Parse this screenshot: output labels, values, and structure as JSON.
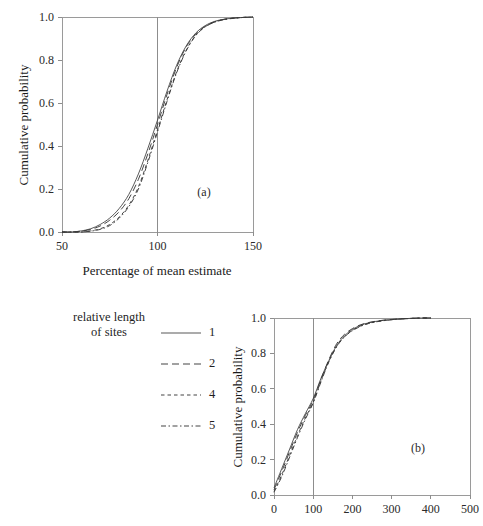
{
  "figure": {
    "background": "#ffffff",
    "line_color": "#3a3a3a",
    "frame_color": "#9a9a9a"
  },
  "legend": {
    "title_line_1": "relative length",
    "title_line_2": "of sites",
    "entries": [
      {
        "key": "1",
        "style": "solid"
      },
      {
        "key": "2",
        "style": "long-dash"
      },
      {
        "key": "4",
        "style": "short-dash"
      },
      {
        "key": "5",
        "style": "dash-dot"
      }
    ]
  },
  "chart_data": [
    {
      "type": "line",
      "tag": "(a)",
      "title": "",
      "xlabel": "Percentage of mean estimate",
      "ylabel": "Cumulative probability",
      "xlim": [
        50,
        150
      ],
      "ylim": [
        0.0,
        1.0
      ],
      "xticks": [
        50,
        100,
        150
      ],
      "xticklabels": [
        "50",
        "100",
        "150"
      ],
      "yticks": [
        0.0,
        0.2,
        0.4,
        0.6,
        0.8,
        1.0
      ],
      "yticklabels": [
        "0.0",
        "0.2",
        "0.4",
        "0.6",
        "0.8",
        "1.0"
      ],
      "grid": false,
      "reference_line_x": 100,
      "legend_position": "external-left",
      "x": [
        50,
        55,
        60,
        65,
        70,
        75,
        80,
        85,
        90,
        95,
        100,
        105,
        110,
        115,
        120,
        125,
        130,
        135,
        140,
        145,
        150
      ],
      "series": [
        {
          "name": "1",
          "style": "solid",
          "values": [
            0.0,
            0.0,
            0.005,
            0.015,
            0.035,
            0.065,
            0.11,
            0.175,
            0.27,
            0.39,
            0.52,
            0.655,
            0.775,
            0.865,
            0.925,
            0.96,
            0.98,
            0.99,
            0.995,
            0.998,
            1.0
          ]
        },
        {
          "name": "2",
          "style": "long-dash",
          "values": [
            0.0,
            0.0,
            0.004,
            0.012,
            0.028,
            0.055,
            0.095,
            0.155,
            0.245,
            0.365,
            0.5,
            0.64,
            0.765,
            0.86,
            0.92,
            0.957,
            0.978,
            0.989,
            0.995,
            0.998,
            1.0
          ]
        },
        {
          "name": "4",
          "style": "short-dash",
          "values": [
            0.0,
            0.0,
            0.0,
            0.005,
            0.015,
            0.035,
            0.07,
            0.125,
            0.21,
            0.335,
            0.475,
            0.615,
            0.745,
            0.845,
            0.915,
            0.955,
            0.977,
            0.989,
            0.995,
            0.998,
            1.0
          ]
        },
        {
          "name": "5",
          "style": "dash-dot",
          "values": [
            0.0,
            0.0,
            0.0,
            0.004,
            0.012,
            0.03,
            0.065,
            0.118,
            0.2,
            0.325,
            0.465,
            0.608,
            0.74,
            0.842,
            0.913,
            0.954,
            0.976,
            0.988,
            0.994,
            0.998,
            1.0
          ]
        }
      ]
    },
    {
      "type": "line",
      "tag": "(b)",
      "title": "",
      "xlabel": "",
      "ylabel": "Cumulative probability",
      "xlim": [
        0,
        500
      ],
      "ylim": [
        0.0,
        1.0
      ],
      "xticks": [
        0,
        100,
        200,
        300,
        400,
        500
      ],
      "xticklabels": [
        "0",
        "100",
        "200",
        "300",
        "400",
        "500"
      ],
      "yticks": [
        0.0,
        0.2,
        0.4,
        0.6,
        0.8,
        1.0
      ],
      "yticklabels": [
        "0.0",
        "0.2",
        "0.4",
        "0.6",
        "0.8",
        "1.0"
      ],
      "grid": false,
      "reference_line_x": 100,
      "x": [
        0,
        20,
        40,
        60,
        80,
        100,
        120,
        140,
        160,
        180,
        200,
        220,
        240,
        260,
        280,
        300,
        320,
        340,
        360,
        380,
        400
      ],
      "series": [
        {
          "name": "1",
          "style": "solid",
          "values": [
            0.04,
            0.15,
            0.26,
            0.37,
            0.46,
            0.545,
            0.66,
            0.76,
            0.845,
            0.9,
            0.935,
            0.958,
            0.972,
            0.981,
            0.987,
            0.991,
            0.994,
            0.997,
            0.999,
            1.0,
            1.0
          ]
        },
        {
          "name": "2",
          "style": "long-dash",
          "values": [
            0.03,
            0.135,
            0.245,
            0.355,
            0.45,
            0.535,
            0.655,
            0.765,
            0.855,
            0.908,
            0.94,
            0.961,
            0.974,
            0.982,
            0.988,
            0.992,
            0.995,
            0.997,
            0.999,
            1.0,
            1.0
          ]
        },
        {
          "name": "4",
          "style": "short-dash",
          "values": [
            0.02,
            0.115,
            0.225,
            0.335,
            0.435,
            0.525,
            0.645,
            0.755,
            0.84,
            0.895,
            0.93,
            0.954,
            0.969,
            0.979,
            0.986,
            0.991,
            0.994,
            0.997,
            0.999,
            1.0,
            1.0
          ]
        },
        {
          "name": "5",
          "style": "dash-dot",
          "values": [
            0.015,
            0.105,
            0.215,
            0.325,
            0.428,
            0.52,
            0.64,
            0.752,
            0.838,
            0.893,
            0.928,
            0.952,
            0.968,
            0.978,
            0.985,
            0.99,
            0.994,
            0.996,
            0.998,
            1.0,
            1.0
          ]
        }
      ]
    }
  ]
}
